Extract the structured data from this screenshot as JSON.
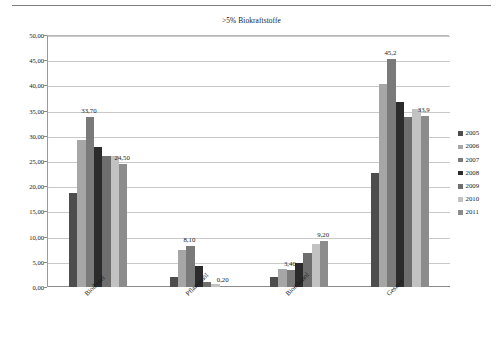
{
  "chart_data": {
    "type": "bar",
    "title": ">5% Biokraftstoffe",
    "xlabel": "",
    "ylabel": "Mrd. kWh",
    "ylim": [
      0,
      50
    ],
    "ytick_step": 5,
    "ytick_labels": [
      "0,00",
      "5,00",
      "10,00",
      "15,00",
      "20,00",
      "25,00",
      "30,00",
      "35,00",
      "40,00",
      "45,00",
      "50,00"
    ],
    "grid": true,
    "legend_position": "right",
    "categories": [
      "Biodiesel",
      "Pflanzenöl",
      "Bioethanol",
      "Gesamt"
    ],
    "series": [
      {
        "name": "2005",
        "color": "#4d4d4d",
        "values": [
          18.6,
          2.0,
          1.9,
          22.6
        ]
      },
      {
        "name": "2006",
        "color": "#a6a6a6",
        "values": [
          29.2,
          7.4,
          3.5,
          40.3
        ]
      },
      {
        "name": "2007",
        "color": "#7a7a7a",
        "values": [
          33.7,
          8.1,
          3.4,
          45.2
        ]
      },
      {
        "name": "2008",
        "color": "#2b2b2b",
        "values": [
          27.7,
          4.2,
          4.7,
          36.8
        ]
      },
      {
        "name": "2009",
        "color": "#6e6e6e",
        "values": [
          26.0,
          1.0,
          6.7,
          33.8
        ]
      },
      {
        "name": "2010",
        "color": "#c2c2c2",
        "values": [
          26.0,
          0.5,
          8.6,
          35.4
        ]
      },
      {
        "name": "2011",
        "color": "#8c8c8c",
        "values": [
          24.5,
          0.2,
          9.2,
          33.9
        ]
      }
    ],
    "annotations": [
      {
        "text": "33,70",
        "category": "Biodiesel",
        "series": "2007",
        "value": 33.7
      },
      {
        "text": "24,50",
        "category": "Biodiesel",
        "series": "2011",
        "value": 24.5
      },
      {
        "text": "8,10",
        "category": "Pflanzenöl",
        "series": "2007",
        "value": 8.1
      },
      {
        "text": "0,20",
        "category": "Pflanzenöl",
        "series": "2011",
        "value": 0.2
      },
      {
        "text": "3,40",
        "category": "Bioethanol",
        "series": "2007",
        "value": 3.4
      },
      {
        "text": "9,20",
        "category": "Bioethanol",
        "series": "2011",
        "value": 9.2
      },
      {
        "text": "45,2",
        "category": "Gesamt",
        "series": "2007",
        "value": 45.2
      },
      {
        "text": "33,9",
        "category": "Gesamt",
        "series": "2011",
        "value": 33.9
      }
    ]
  },
  "legend": {
    "items": [
      {
        "label": "2005"
      },
      {
        "label": "2006"
      },
      {
        "label": "2007"
      },
      {
        "label": "2008"
      },
      {
        "label": "2009"
      },
      {
        "label": "2010"
      },
      {
        "label": "2011"
      }
    ]
  }
}
